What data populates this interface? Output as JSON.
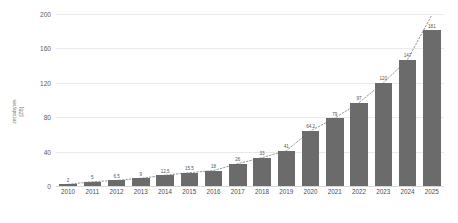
{
  "chart_data": {
    "type": "bar",
    "title": "",
    "xlabel": "",
    "ylabel_line1": "zettabytes",
    "ylabel_line2": "[ZB]",
    "categories": [
      "2010",
      "2011",
      "2012",
      "2013",
      "2014",
      "2015",
      "2016",
      "2017",
      "2018",
      "2019",
      "2020",
      "2021",
      "2022",
      "2023",
      "2024",
      "2025"
    ],
    "values": [
      2,
      5,
      6.5,
      9,
      12.5,
      15.5,
      18,
      26,
      33,
      41,
      64.2,
      79,
      97,
      120,
      147,
      181
    ],
    "value_labels": [
      "2",
      "5",
      "6.5",
      "9",
      "12.5",
      "15.5",
      "18",
      "26",
      "33",
      "41",
      "64.2",
      "79",
      "97",
      "120",
      "147",
      "181"
    ],
    "ylim": [
      0,
      200
    ],
    "yticks": [
      200,
      160,
      120,
      80,
      40,
      0
    ],
    "ytick_labels": [
      "200",
      "160",
      "120",
      "80",
      "40",
      "0"
    ],
    "grid": true,
    "legend": "none",
    "bar_color": "#6b6b6b",
    "grid_color": "#e9e9e9",
    "trendline": {
      "style": "dotted",
      "color": "#9a9a9a",
      "values": [
        2,
        5,
        6.5,
        9,
        12.5,
        15.5,
        18,
        26,
        33,
        41,
        64.2,
        79,
        97,
        120,
        147,
        199
      ]
    }
  }
}
